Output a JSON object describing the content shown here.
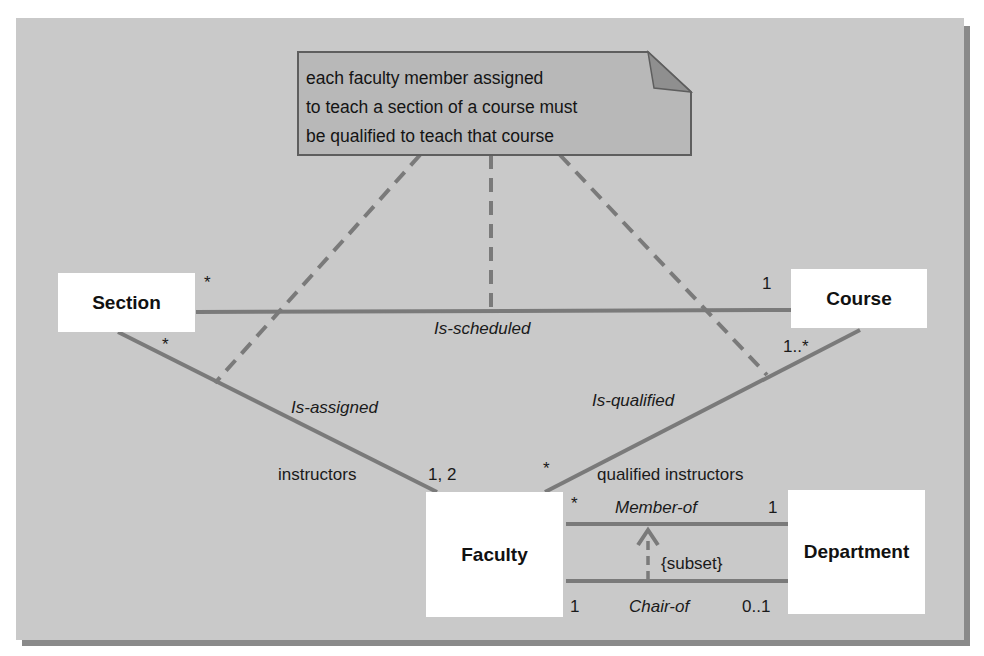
{
  "note": {
    "lines": [
      "each faculty member assigned",
      "to teach a section of a course must",
      "be qualified to teach that course"
    ]
  },
  "classes": {
    "section": "Section",
    "course": "Course",
    "faculty": "Faculty",
    "department": "Department"
  },
  "associations": {
    "is_scheduled": {
      "name": "Is-scheduled",
      "mult_section": "*",
      "mult_course": "1"
    },
    "is_assigned": {
      "name": "Is-assigned",
      "mult_section": "*",
      "mult_faculty": "1, 2",
      "role_faculty": "instructors"
    },
    "is_qualified": {
      "name": "Is-qualified",
      "mult_course": "1..*",
      "mult_faculty": "*",
      "role_faculty": "qualified instructors"
    },
    "member_of": {
      "name": "Member-of",
      "mult_faculty": "*",
      "mult_department": "1"
    },
    "chair_of": {
      "name": "Chair-of",
      "mult_faculty": "1",
      "mult_department": "0..1"
    },
    "constraint": "{subset}"
  },
  "colors": {
    "background": "#c9c9c9",
    "line": "#7a7a7a",
    "note_fill": "#b8b8b8",
    "note_fold": "#8f8f8f",
    "box": "#ffffff"
  }
}
